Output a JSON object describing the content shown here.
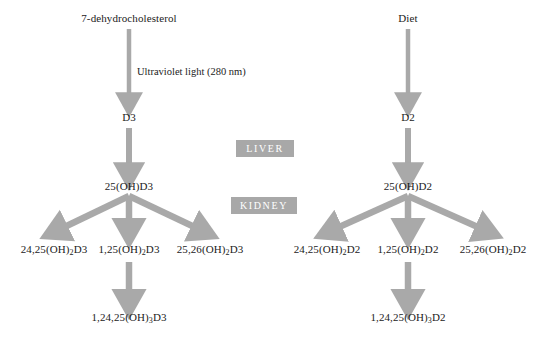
{
  "diagram": {
    "background_color": "#ffffff",
    "arrow_color": "#a9a9a9",
    "organ_box_color": "#a8a8a8",
    "organ_text_color": "#ffffff",
    "text_color": "#222222"
  },
  "annotations": {
    "uv_light": "Ultraviolet light (280 nm)"
  },
  "organs": {
    "liver": "LIVER",
    "kidney": "KIDNEY"
  },
  "d3_branch": {
    "source": "7-dehydrocholesterol",
    "precursor": "D3",
    "hydroxylated": "25(OH)D3",
    "metabolites": [
      {
        "prefix": "24,25(OH)",
        "sub": "2",
        "suffix": "D3"
      },
      {
        "prefix": "1,25(OH)",
        "sub": "2",
        "suffix": "D3"
      },
      {
        "prefix": "25,26(OH)",
        "sub": "2",
        "suffix": "D3"
      }
    ],
    "terminal": {
      "prefix": "1,24,25(OH)",
      "sub": "3",
      "suffix": "D3"
    }
  },
  "d2_branch": {
    "source": "Diet",
    "precursor": "D2",
    "hydroxylated": "25(OH)D2",
    "metabolites": [
      {
        "prefix": "24,25(OH)",
        "sub": "2",
        "suffix": "D2"
      },
      {
        "prefix": "1,25(OH)",
        "sub": "2",
        "suffix": "D2"
      },
      {
        "prefix": "25,26(OH)",
        "sub": "2",
        "suffix": "D2"
      }
    ],
    "terminal": {
      "prefix": "1,24,25(OH)",
      "sub": "3",
      "suffix": "D2"
    }
  }
}
